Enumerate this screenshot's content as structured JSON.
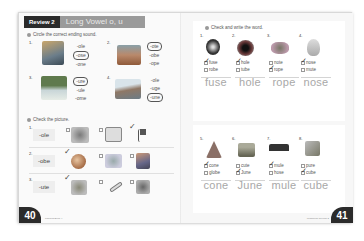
{
  "header": {
    "review_label": "Review 2",
    "title": "Long Vowel o, u"
  },
  "left_page": {
    "section_a": {
      "instruction": "Circle the correct ending sound.",
      "items": [
        {
          "num": "1.",
          "picture": "robot-icon",
          "options": [
            "-ole",
            "-ose",
            "-one"
          ],
          "circled": 1
        },
        {
          "num": "2.",
          "picture": "vote-box-icon",
          "options": [
            "-ote",
            "-obe",
            "-ope"
          ],
          "circled": 0
        },
        {
          "num": "3.",
          "picture": "plant-icon",
          "options": [
            "-ure",
            "-ule",
            "-ome"
          ],
          "circled": 0
        },
        {
          "num": "4.",
          "picture": "dune-icon",
          "options": [
            "-ole",
            "-uge",
            "-une"
          ],
          "circled": 2
        }
      ]
    },
    "section_b": {
      "instruction": "Check the picture.",
      "rows": [
        {
          "num": "1.",
          "word": "-ole",
          "pictures": [
            "mole-icon",
            "note-icon",
            "pole-flag-icon"
          ],
          "checked": 2
        },
        {
          "num": "2.",
          "word": "-obe",
          "pictures": [
            "globe-icon",
            "elephant-icon",
            "robot-icon"
          ],
          "checked": 0
        },
        {
          "num": "3.",
          "word": "-ute",
          "pictures": [
            "flute-icon",
            "bone-icon",
            "mouse-icon"
          ],
          "checked": 0
        }
      ]
    },
    "page_number": "40",
    "footer": "Phonics Book 4"
  },
  "right_page": {
    "instruction": "Check and write the word.",
    "top_items": [
      {
        "num": "1.",
        "picture": "fuse-icon",
        "choices": [
          "fuse",
          "robe"
        ],
        "checked": 0,
        "written": "fuse"
      },
      {
        "num": "2.",
        "picture": "hole-icon",
        "choices": [
          "hole",
          "tube"
        ],
        "checked": 0,
        "written": "hole"
      },
      {
        "num": "3.",
        "picture": "rope-icon",
        "choices": [
          "note",
          "rope"
        ],
        "checked": 1,
        "written": "rope"
      },
      {
        "num": "4.",
        "picture": "nose-icon",
        "choices": [
          "nose",
          "mute"
        ],
        "checked": 0,
        "written": "nose"
      }
    ],
    "bottom_items": [
      {
        "num": "5.",
        "picture": "cone-icon",
        "choices": [
          "cone",
          "globe"
        ],
        "checked": 0,
        "written": "cone"
      },
      {
        "num": "6.",
        "picture": "calendar-icon",
        "choices": [
          "cute",
          "June"
        ],
        "checked": 1,
        "written": "June"
      },
      {
        "num": "7.",
        "picture": "mule-icon",
        "choices": [
          "mule",
          "hose"
        ],
        "checked": 0,
        "written": "mule"
      },
      {
        "num": "8.",
        "picture": "cube-icon",
        "choices": [
          "pure",
          "cube"
        ],
        "checked": 1,
        "written": "cube"
      }
    ],
    "page_number": "41",
    "footer": "Workbook Review 2"
  }
}
